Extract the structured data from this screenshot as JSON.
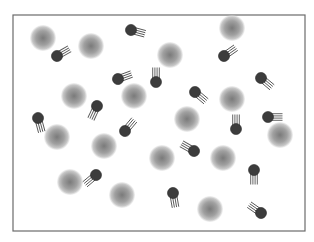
{
  "diagram": {
    "width": 314,
    "height": 242,
    "frame": {
      "x": 13,
      "y": 15,
      "width": 292,
      "height": 216,
      "stroke": "#6b6b6b",
      "fill": "#ffffff"
    },
    "colors": {
      "sphere_center": "#7a7a7a",
      "sphere_mid": "#a0a0a0",
      "sphere_edge": "#c8c8c8",
      "head_fill": "#3c3c3c",
      "head_stroke": "#2a2a2a",
      "tail_stroke": "#555555"
    },
    "large_spheres": [
      {
        "x": 43,
        "y": 38,
        "r": 13
      },
      {
        "x": 91,
        "y": 46,
        "r": 13
      },
      {
        "x": 232,
        "y": 28,
        "r": 13
      },
      {
        "x": 170,
        "y": 55,
        "r": 13
      },
      {
        "x": 74,
        "y": 96,
        "r": 13
      },
      {
        "x": 134,
        "y": 96,
        "r": 13
      },
      {
        "x": 232,
        "y": 99,
        "r": 13
      },
      {
        "x": 187,
        "y": 119,
        "r": 13
      },
      {
        "x": 57,
        "y": 137,
        "r": 13
      },
      {
        "x": 104,
        "y": 146,
        "r": 13
      },
      {
        "x": 280,
        "y": 135,
        "r": 13
      },
      {
        "x": 162,
        "y": 158,
        "r": 13
      },
      {
        "x": 223,
        "y": 158,
        "r": 13
      },
      {
        "x": 70,
        "y": 182,
        "r": 13
      },
      {
        "x": 122,
        "y": 195,
        "r": 13
      },
      {
        "x": 210,
        "y": 209,
        "r": 13
      }
    ],
    "small_particles": [
      {
        "x": 57,
        "y": 56,
        "angle": -30
      },
      {
        "x": 131,
        "y": 30,
        "angle": 15
      },
      {
        "x": 224,
        "y": 56,
        "angle": -35
      },
      {
        "x": 118,
        "y": 79,
        "angle": -20
      },
      {
        "x": 156,
        "y": 82,
        "angle": -90
      },
      {
        "x": 261,
        "y": 78,
        "angle": 40
      },
      {
        "x": 97,
        "y": 106,
        "angle": 115
      },
      {
        "x": 195,
        "y": 92,
        "angle": 40
      },
      {
        "x": 38,
        "y": 118,
        "angle": 75
      },
      {
        "x": 125,
        "y": 131,
        "angle": -50
      },
      {
        "x": 236,
        "y": 129,
        "angle": -90
      },
      {
        "x": 268,
        "y": 117,
        "angle": 0
      },
      {
        "x": 194,
        "y": 151,
        "angle": -150
      },
      {
        "x": 96,
        "y": 175,
        "angle": 140
      },
      {
        "x": 254,
        "y": 170,
        "angle": 90
      },
      {
        "x": 173,
        "y": 193,
        "angle": 80
      },
      {
        "x": 261,
        "y": 213,
        "angle": -145
      }
    ],
    "particle_geometry": {
      "head_r": 5.5,
      "tail_count": 4,
      "tail_length": 9,
      "tail_spacing": 2.2
    }
  }
}
